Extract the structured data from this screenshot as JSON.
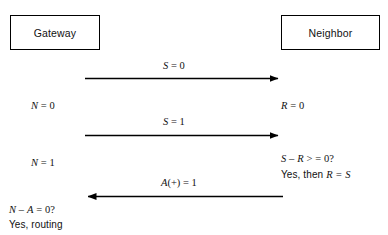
{
  "diagram": {
    "type": "sequence-diagram",
    "background_color": "#ffffff",
    "line_color": "#000000",
    "text_color": "#111111"
  },
  "nodes": {
    "gateway": {
      "label": "Gateway"
    },
    "neighbor": {
      "label": "Neighbor"
    }
  },
  "messages": [
    {
      "id": "msg-1",
      "direction": "gateway-to-neighbor",
      "label_var": "S",
      "label_op": " = ",
      "label_value": "0",
      "label_full": "S = 0"
    },
    {
      "id": "msg-2",
      "direction": "gateway-to-neighbor",
      "label_var": "S",
      "label_op": " = ",
      "label_value": "1",
      "label_full": "S = 1"
    },
    {
      "id": "msg-3",
      "direction": "neighbor-to-gateway",
      "label_var": "A",
      "label_op": "(+) = ",
      "label_value": "1",
      "label_full": "A(+) = 1"
    }
  ],
  "gateway_notes": [
    {
      "id": "note-n0",
      "var": "N",
      "op": " = ",
      "value": "0",
      "full": "N = 0"
    },
    {
      "id": "note-n1",
      "var": "N",
      "op": " = ",
      "value": "1",
      "full": "N = 1"
    },
    {
      "id": "note-na",
      "var": "N",
      "op": " – ",
      "var2": "A",
      "op2": " = ",
      "value": "0?",
      "full": "N – A = 0?"
    },
    {
      "id": "note-routing",
      "text": "Yes, routing"
    }
  ],
  "neighbor_notes": [
    {
      "id": "note-r0",
      "var": "R",
      "op": " = ",
      "value": "0",
      "full": "R = 0"
    },
    {
      "id": "note-sr",
      "var": "S",
      "op": " – ",
      "var2": "R",
      "op2": " > ",
      "op3": " = ",
      "value": "0?",
      "full": "S – R >  = 0?"
    },
    {
      "id": "note-yes-rs",
      "prefix": "Yes, then ",
      "var": "R",
      "op": " = ",
      "var2": "S",
      "full": "Yes, then R = S"
    }
  ]
}
